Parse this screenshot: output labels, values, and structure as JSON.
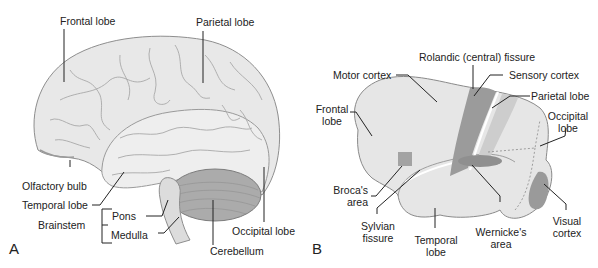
{
  "panels": {
    "a": {
      "letter": "A",
      "labels": {
        "frontal_lobe": "Frontal lobe",
        "parietal_lobe": "Parietal lobe",
        "olfactory_bulb": "Olfactory bulb",
        "temporal_lobe": "Temporal lobe",
        "brainstem": "Brainstem",
        "pons": "Pons",
        "medulla": "Medulla",
        "cerebellum": "Cerebellum",
        "occipital_lobe": "Occipital lobe"
      }
    },
    "b": {
      "letter": "B",
      "labels": {
        "rolandic_fissure": "Rolandic (central) fissure",
        "motor_cortex": "Motor cortex",
        "sensory_cortex": "Sensory cortex",
        "parietal_lobe": "Parietal lobe",
        "frontal_lobe_1": "Frontal",
        "frontal_lobe_2": "lobe",
        "occipital_lobe_1": "Occipital",
        "occipital_lobe_2": "lobe",
        "brocas_area_1": "Broca's",
        "brocas_area_2": "area",
        "sylvian_fissure_1": "Sylvian",
        "sylvian_fissure_2": "fissure",
        "temporal_lobe_1": "Temporal",
        "temporal_lobe_2": "lobe",
        "wernickes_area_1": "Wernicke's",
        "wernickes_area_2": "area",
        "visual_cortex_1": "Visual",
        "visual_cortex_2": "cortex"
      }
    }
  },
  "colors": {
    "brain_fill": "#e6e6e6",
    "brain_outline": "#8a8a8a",
    "cerebellum_fill": "#a9a9a9",
    "region_dark": "#9b9b9b",
    "region_light": "#cfcfcf",
    "leader_line": "#222222"
  }
}
